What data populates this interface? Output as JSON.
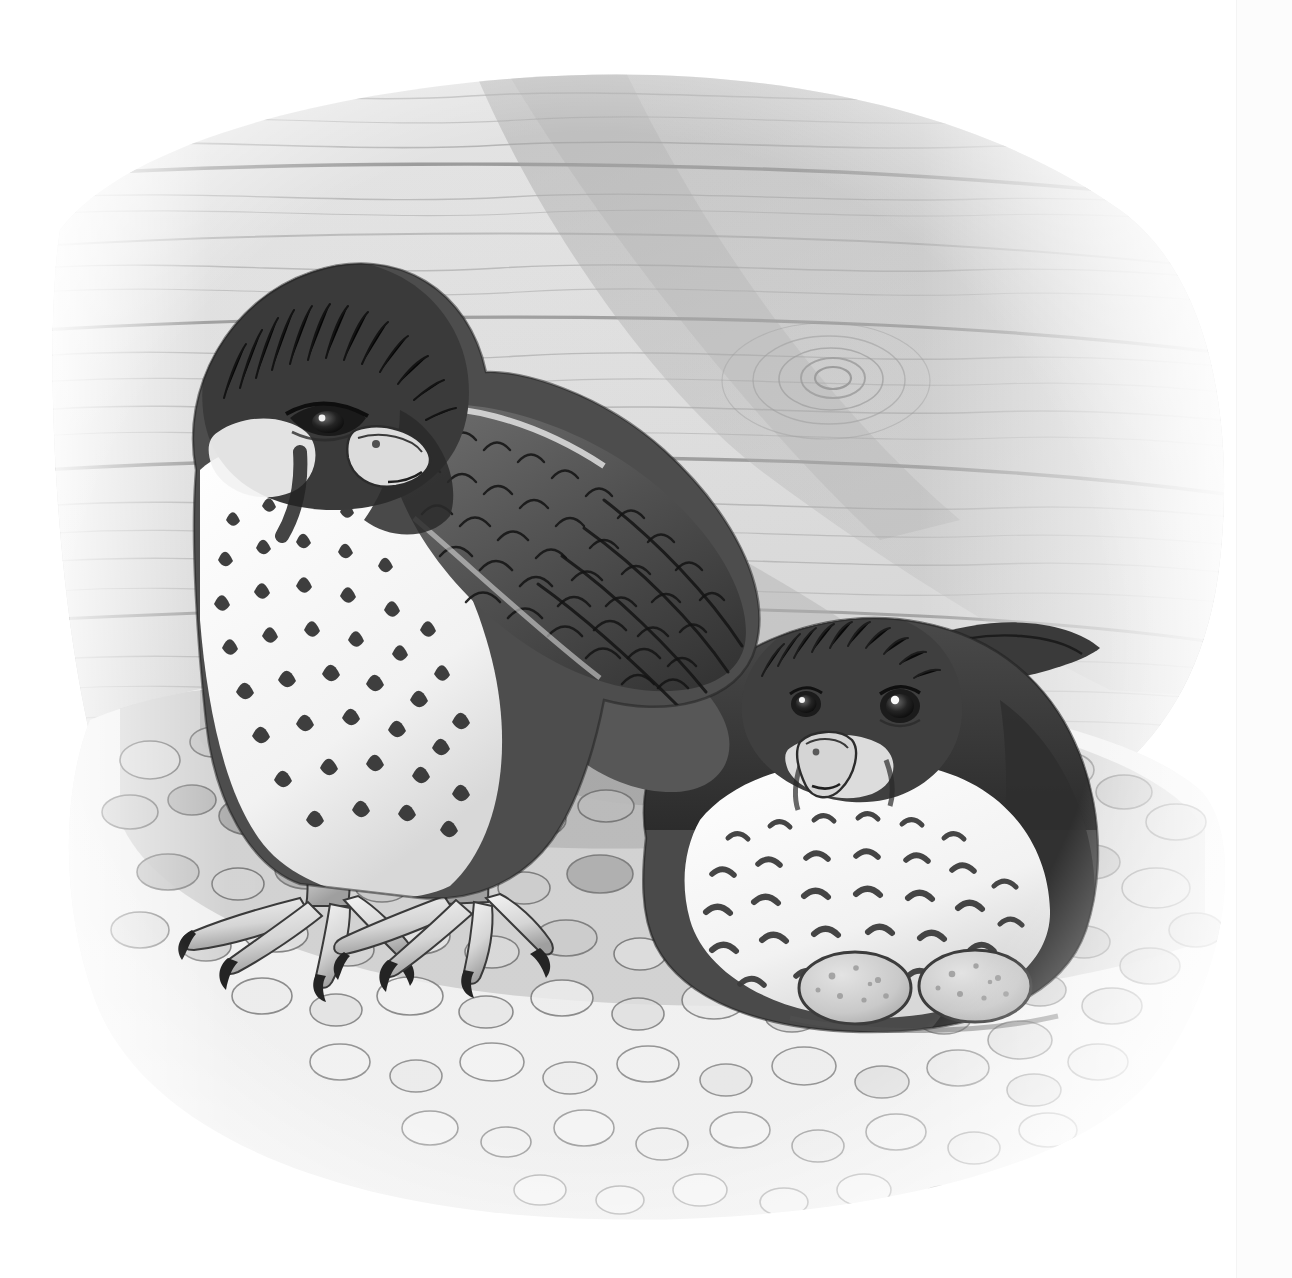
{
  "artwork": {
    "title": "Two falcons at a gravel nest scrape beside a weathered wooden wall",
    "medium": "pen-and-ink line drawing with grey watercolour wash",
    "palette": {
      "paper": "#ffffff",
      "page_edge": "#fcfcfc",
      "wood_light": "#e9e9e9",
      "wood_mid": "#d6d6d6",
      "wood_shadow": "#b4b4b4",
      "wood_deep_shadow": "#9a9a9a",
      "grain_line": "#8d8d8d",
      "gravel_light": "#ededed",
      "gravel_mid": "#c9c9c9",
      "gravel_dark": "#9e9e9e",
      "gravel_outline": "#6f6f6f",
      "plumage_dark": "#3a3a3a",
      "plumage_darkest": "#1d1d1d",
      "plumage_mid": "#757575",
      "breast_white": "#fbfbfb",
      "beak": "#d9d9d9",
      "talon": "#242424",
      "egg_fill": "#cfcfcf",
      "egg_speck": "#9b9b9b",
      "ink": "#2b2b2b"
    },
    "subjects": [
      {
        "name": "standing-falcon",
        "pose": "standing, head lowered and turned toward viewer, wing folded over back",
        "features": [
          "dark hooded crown and nape",
          "dark malar stripe below eye",
          "pale cheek patch",
          "white breast with dark teardrop and chevron streaks",
          "scalloped grey wing coverts",
          "yellow-pale scaled legs with dark curved talons"
        ]
      },
      {
        "name": "brooding-falcon",
        "pose": "crouched low over the scrape, both eyes facing viewer, wings tucked",
        "features": [
          "dark crown and nape",
          "pale throat and moustachial line",
          "heavily barred and spotted white breast",
          "folded wing tip projecting to the right"
        ]
      }
    ],
    "nest": {
      "type": "gravel scrape",
      "egg_count": 2,
      "eggs": [
        {
          "label": "egg-left",
          "description": "speckled buff egg resting against the brooding bird"
        },
        {
          "label": "egg-right",
          "description": "speckled buff egg, partly tucked under the breast"
        }
      ]
    },
    "background": {
      "surface": "horizontal weathered wooden planks",
      "plank_seams": 5,
      "knot_count": 1,
      "cast_shadow": "diagonal shadow falling from upper right across the planks",
      "vignette": "wash fades to bare white paper at all four edges"
    }
  },
  "labels": {
    "standing_falcon": "Standing falcon",
    "brooding_falcon": "Brooding falcon",
    "eggs": "Eggs in gravel scrape",
    "wood_wall": "Weathered plank wall",
    "gravel": "Gravel scrape",
    "knot": "Wood knot",
    "cast_shadow": "Cast shadow"
  }
}
